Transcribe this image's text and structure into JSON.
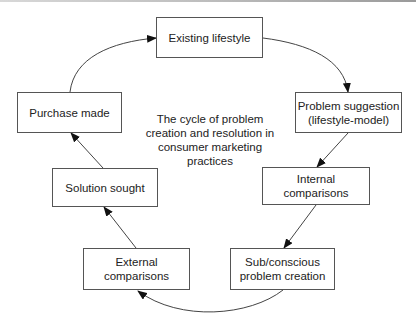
{
  "diagram": {
    "title": "The cycle of problem creation and resolution in consumer marketing practices",
    "title_lines": [
      "The cycle of problem",
      "creation and resolution in",
      "consumer marketing",
      "practices"
    ],
    "nodes": [
      {
        "id": "existing",
        "label_lines": [
          "Existing lifestyle"
        ]
      },
      {
        "id": "problem-suggestion",
        "label_lines": [
          "Problem suggestion",
          "(lifestyle-model)"
        ]
      },
      {
        "id": "internal",
        "label_lines": [
          "Internal comparisons"
        ]
      },
      {
        "id": "subconscious",
        "label_lines": [
          "Sub/conscious",
          "problem creation"
        ]
      },
      {
        "id": "external",
        "label_lines": [
          "External",
          "comparisons"
        ]
      },
      {
        "id": "solution",
        "label_lines": [
          "Solution sought"
        ]
      },
      {
        "id": "purchase",
        "label_lines": [
          "Purchase made"
        ]
      }
    ],
    "edges": [
      {
        "from": "existing",
        "to": "problem-suggestion",
        "style": "curved"
      },
      {
        "from": "problem-suggestion",
        "to": "internal",
        "style": "straight"
      },
      {
        "from": "internal",
        "to": "subconscious",
        "style": "straight"
      },
      {
        "from": "subconscious",
        "to": "external",
        "style": "curved"
      },
      {
        "from": "external",
        "to": "solution",
        "style": "straight"
      },
      {
        "from": "solution",
        "to": "purchase",
        "style": "straight"
      },
      {
        "from": "purchase",
        "to": "existing",
        "style": "curved"
      }
    ],
    "colors": {
      "stroke": "#555555",
      "arrow": "#111111",
      "text": "#222222",
      "background": "#ffffff"
    }
  }
}
